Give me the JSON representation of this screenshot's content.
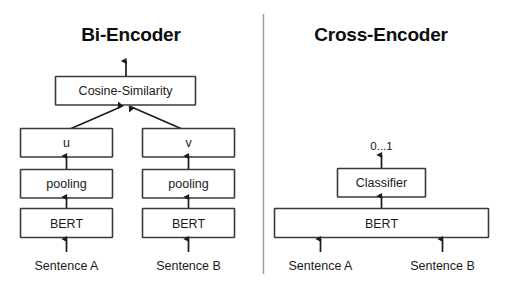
{
  "figure": {
    "background_color": "#ffffff",
    "line_color": "#1a1a1a",
    "box_stroke_color": "#3a3a3a",
    "divider_color": "#9a9a9a",
    "text_color": "#1a1a1a"
  },
  "panels": {
    "left": {
      "title": "Bi-Encoder",
      "nodes": {
        "similarity": "Cosine-Similarity",
        "embedding_u": "u",
        "embedding_v": "v",
        "pooling_a": "pooling",
        "pooling_b": "pooling",
        "encoder_a": "BERT",
        "encoder_b": "BERT"
      },
      "inputs": {
        "sentence_a": "Sentence A",
        "sentence_b": "Sentence B"
      }
    },
    "right": {
      "title": "Cross-Encoder",
      "output_label": "0...1",
      "nodes": {
        "classifier": "Classifier",
        "encoder": "BERT"
      },
      "inputs": {
        "sentence_a": "Sentence A",
        "sentence_b": "Sentence B"
      }
    }
  }
}
